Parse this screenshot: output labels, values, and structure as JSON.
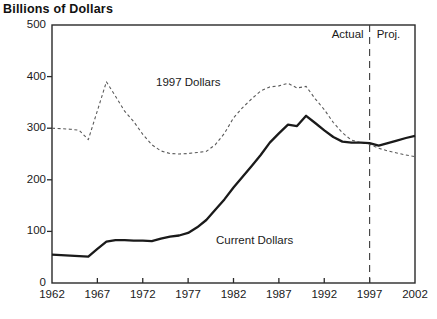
{
  "page": {
    "heading": "Billions of Dollars"
  },
  "chart_data": {
    "type": "line",
    "title": "Billions of Dollars",
    "xlabel": "",
    "ylabel": "Billions of Dollars",
    "xlim": [
      1962,
      2002
    ],
    "ylim": [
      0,
      500
    ],
    "grid": false,
    "legend_position": "in-plot text labels",
    "x_ticks": [
      1962,
      1967,
      1972,
      1977,
      1982,
      1987,
      1992,
      1997,
      2002
    ],
    "y_ticks": [
      0,
      100,
      200,
      300,
      400,
      500
    ],
    "x": [
      1962,
      1963,
      1964,
      1965,
      1966,
      1967,
      1968,
      1969,
      1970,
      1971,
      1972,
      1973,
      1974,
      1975,
      1976,
      1977,
      1978,
      1979,
      1980,
      1981,
      1982,
      1983,
      1984,
      1985,
      1986,
      1987,
      1988,
      1989,
      1990,
      1991,
      1992,
      1993,
      1994,
      1995,
      1996,
      1997,
      1998,
      1999,
      2000,
      2001,
      2002
    ],
    "series": [
      {
        "name": "1997 Dollars",
        "style": "dashed",
        "color": "#5a5a5a",
        "width": 1.1,
        "values": [
          300,
          299,
          298,
          296,
          278,
          334,
          390,
          362,
          333,
          313,
          288,
          268,
          256,
          251,
          250,
          251,
          253,
          255,
          268,
          290,
          320,
          340,
          357,
          372,
          380,
          382,
          387,
          378,
          381,
          357,
          336,
          311,
          291,
          277,
          272,
          269,
          261,
          256,
          252,
          248,
          245
        ]
      },
      {
        "name": "Current Dollars",
        "style": "solid",
        "color": "#1a1a1a",
        "width": 2.3,
        "values": [
          55,
          54,
          53,
          52,
          51,
          66,
          80,
          83,
          83,
          82,
          82,
          81,
          86,
          90,
          92,
          97,
          108,
          122,
          142,
          162,
          185,
          206,
          227,
          248,
          272,
          290,
          307,
          304,
          324,
          310,
          296,
          283,
          274,
          272,
          272,
          271,
          266,
          271,
          276,
          281,
          285
        ]
      }
    ],
    "annotations": {
      "divider_x": 1997,
      "divider_style": "vertical dashed line",
      "actual_label": "Actual",
      "proj_label": "Proj.",
      "dashed_series_label": "1997 Dollars",
      "solid_series_label": "Current Dollars"
    },
    "frame_color": "#2a2a2a"
  }
}
